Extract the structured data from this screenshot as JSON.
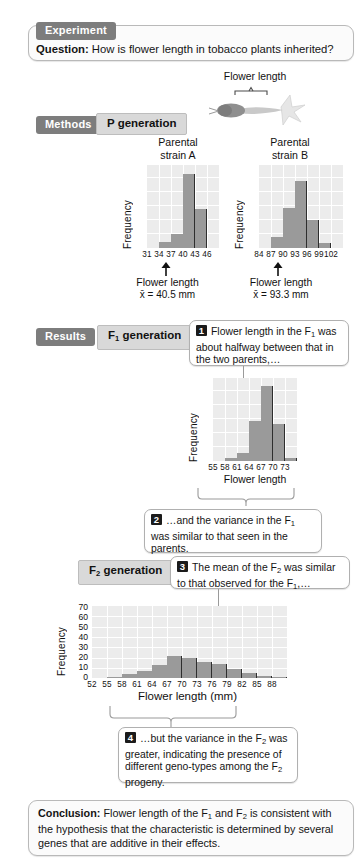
{
  "header": {
    "tab": "Experiment",
    "question_label": "Question:",
    "question_text": "How is flower length in tobacco plants inherited?"
  },
  "flower_diagram": {
    "label": "Flower length",
    "icon": "tobacco-flower-illustration"
  },
  "methods": {
    "tab": "Methods",
    "generation_label": "P generation"
  },
  "results": {
    "tab": "Results",
    "f1_label": "F₁ generation",
    "f2_label": "F₂ generation"
  },
  "callouts": [
    {
      "number": "1",
      "text": "Flower length in the F₁ was about halfway between that in the two parents,…"
    },
    {
      "number": "2",
      "text": "…and the variance in the F₁ was similar to that seen in the parents."
    },
    {
      "number": "3",
      "text": "The mean of the F₂ was similar to that  observed for the F₁,…"
    },
    {
      "number": "4",
      "text": "…but the variance in the F₂ was greater, indicating the presence of different geno-types among the F₂ progeny."
    }
  ],
  "conclusion": {
    "label": "Conclusion:",
    "text": "Flower length of the F₁ and F₂ is consistent with the hypothesis that the characteristic is determined by several genes that are additive in their effects."
  },
  "chart_data": [
    {
      "type": "bar",
      "id": "parental-strain-a",
      "title": "Parental strain A",
      "xlabel": "Flower length",
      "ylabel": "Frequency",
      "mean_label": "x̄ = 40.5 mm",
      "mean_value": 40.5,
      "categories": [
        "31",
        "34",
        "37",
        "40",
        "43",
        "46"
      ],
      "values": [
        0,
        4,
        9,
        46,
        24,
        0
      ],
      "ylim": [
        0,
        52
      ],
      "grid": true,
      "mean_marker": "arrow-below-axis"
    },
    {
      "type": "bar",
      "id": "parental-strain-b",
      "title": "Parental strain B",
      "xlabel": "Flower length",
      "ylabel": "Frequency",
      "mean_label": "x̄ = 93.3 mm",
      "mean_value": 93.3,
      "categories": [
        "84",
        "87",
        "90",
        "93",
        "96",
        "99",
        "102"
      ],
      "values": [
        0,
        7,
        25,
        42,
        17,
        3,
        0
      ],
      "ylim": [
        0,
        52
      ],
      "grid": true,
      "mean_marker": "arrow-below-axis"
    },
    {
      "type": "bar",
      "id": "f1-generation",
      "title": "",
      "xlabel": "Flower length",
      "ylabel": "Frequency",
      "categories": [
        "55",
        "58",
        "61",
        "64",
        "67",
        "70",
        "73"
      ],
      "values": [
        0,
        2,
        5,
        25,
        47,
        23,
        2
      ],
      "ylim": [
        0,
        52
      ],
      "grid": true
    },
    {
      "type": "bar",
      "id": "f2-generation",
      "title": "",
      "xlabel": "Flower length (mm)",
      "ylabel": "Frequency",
      "categories": [
        "52",
        "55",
        "58",
        "61",
        "64",
        "67",
        "70",
        "73",
        "76",
        "79",
        "82",
        "85",
        "88"
      ],
      "values": [
        0,
        1,
        4,
        7,
        13,
        21,
        19,
        16,
        14,
        9,
        5,
        2,
        1
      ],
      "yticks": [
        "0",
        "10",
        "20",
        "30",
        "40",
        "50",
        "60",
        "70"
      ],
      "ylim": [
        0,
        70
      ],
      "grid": true
    }
  ]
}
